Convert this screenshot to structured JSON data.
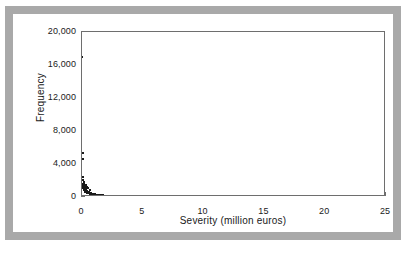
{
  "figure": {
    "frame_color": "#a9a9a9",
    "background": "#ffffff",
    "axis_color": "#6e6e6e",
    "marker_color": "#1a1a1a"
  },
  "chart_data": {
    "type": "scatter",
    "title": "",
    "xlabel": "Severity (million euros)",
    "ylabel": "Frequency",
    "xlim": [
      0,
      25
    ],
    "ylim": [
      0,
      20000
    ],
    "xticks": [
      0,
      5,
      10,
      15,
      20,
      25
    ],
    "xticklabels": [
      "0",
      "5",
      "10",
      "15",
      "20",
      "25"
    ],
    "yticks": [
      0,
      4000,
      8000,
      12000,
      16000,
      20000
    ],
    "yticklabels": [
      "0",
      "4,000",
      "8,000",
      "12,000",
      "16,000",
      "20,000"
    ],
    "grid": false,
    "legend": null,
    "marker": "square",
    "marker_size_px": 2,
    "points": [
      [
        0.02,
        17000
      ],
      [
        0.05,
        5300
      ],
      [
        0.07,
        4600
      ],
      [
        0.1,
        2400
      ],
      [
        0.12,
        2050
      ],
      [
        0.14,
        1850
      ],
      [
        0.16,
        1700
      ],
      [
        0.18,
        1500
      ],
      [
        0.2,
        1350
      ],
      [
        0.23,
        1200
      ],
      [
        0.26,
        1080
      ],
      [
        0.29,
        980
      ],
      [
        0.32,
        900
      ],
      [
        0.36,
        830
      ],
      [
        0.4,
        760
      ],
      [
        0.45,
        700
      ],
      [
        0.3,
        1450
      ],
      [
        0.38,
        1250
      ],
      [
        0.48,
        1100
      ],
      [
        0.5,
        640
      ],
      [
        0.55,
        600
      ],
      [
        0.6,
        560
      ],
      [
        0.62,
        900
      ],
      [
        0.66,
        520
      ],
      [
        0.72,
        480
      ],
      [
        0.78,
        450
      ],
      [
        0.85,
        410
      ],
      [
        0.92,
        380
      ],
      [
        1.0,
        350
      ],
      [
        1.1,
        320
      ],
      [
        1.2,
        290
      ],
      [
        1.32,
        265
      ],
      [
        1.45,
        240
      ],
      [
        1.58,
        215
      ],
      [
        1.72,
        195
      ],
      [
        1.88,
        175
      ],
      [
        2.05,
        155
      ],
      [
        2.25,
        140
      ],
      [
        2.45,
        125
      ],
      [
        2.68,
        110
      ],
      [
        2.92,
        98
      ],
      [
        3.15,
        88
      ],
      [
        0.06,
        1600
      ],
      [
        0.09,
        1300
      ],
      [
        0.11,
        1150
      ],
      [
        0.15,
        1000
      ],
      [
        0.19,
        870
      ],
      [
        0.24,
        750
      ],
      [
        0.28,
        660
      ],
      [
        0.34,
        590
      ],
      [
        0.42,
        520
      ],
      [
        0.52,
        460
      ],
      [
        0.68,
        400
      ],
      [
        0.88,
        340
      ],
      [
        1.15,
        280
      ],
      [
        1.5,
        225
      ],
      [
        1.95,
        180
      ],
      [
        2.55,
        130
      ],
      [
        12.4,
        120
      ],
      [
        21.4,
        150
      ]
    ]
  }
}
